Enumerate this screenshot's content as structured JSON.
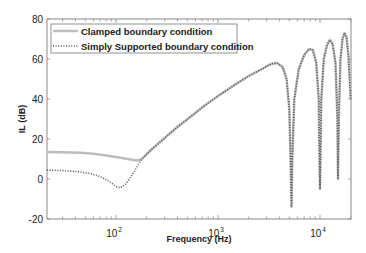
{
  "chart_data": {
    "type": "line",
    "title": "",
    "xlabel": "Frequency (Hz)",
    "ylabel": "IL (dB)",
    "xscale": "log",
    "xlim": [
      21,
      20000
    ],
    "ylim": [
      -20,
      80
    ],
    "yticks": [
      -20,
      0,
      20,
      40,
      60,
      80
    ],
    "yticklabels": [
      "-20",
      "0",
      "20",
      "40",
      "60",
      "80"
    ],
    "xticks": [
      100,
      1000,
      10000
    ],
    "xticklabels": [
      {
        "base": "10",
        "exp": "2"
      },
      {
        "base": "10",
        "exp": "3"
      },
      {
        "base": "10",
        "exp": "4"
      }
    ],
    "grid": false,
    "legend_position": "upper left",
    "series": [
      {
        "name": "Clamped boundary condition",
        "style": "solid",
        "color": "#bdbdbd",
        "points": [
          [
            21,
            13.5
          ],
          [
            30,
            13.4
          ],
          [
            45,
            13.1
          ],
          [
            60,
            12.6
          ],
          [
            80,
            11.8
          ],
          [
            100,
            11.0
          ],
          [
            130,
            10.0
          ],
          [
            160,
            9.2
          ],
          [
            175,
            9.6
          ],
          [
            220,
            14.5
          ],
          [
            300,
            20.5
          ],
          [
            400,
            26
          ],
          [
            550,
            31.5
          ],
          [
            750,
            37
          ],
          [
            1000,
            41.5
          ],
          [
            1500,
            47.5
          ],
          [
            2000,
            51.5
          ],
          [
            2700,
            55
          ],
          [
            3300,
            57.5
          ],
          [
            3800,
            58
          ],
          [
            4300,
            56
          ],
          [
            4700,
            50
          ],
          [
            5000,
            35
          ],
          [
            5150,
            10
          ],
          [
            5250,
            -14
          ],
          [
            5350,
            10
          ],
          [
            5600,
            40
          ],
          [
            6200,
            55
          ],
          [
            7000,
            62
          ],
          [
            7800,
            65
          ],
          [
            8500,
            64.5
          ],
          [
            9200,
            58
          ],
          [
            9700,
            40
          ],
          [
            10000,
            -5
          ],
          [
            10300,
            40
          ],
          [
            10900,
            60
          ],
          [
            11700,
            67
          ],
          [
            12500,
            69.5
          ],
          [
            13300,
            67.5
          ],
          [
            14200,
            58
          ],
          [
            14800,
            30
          ],
          [
            15000,
            0
          ],
          [
            15300,
            30
          ],
          [
            15900,
            60
          ],
          [
            16600,
            70
          ],
          [
            17400,
            73
          ],
          [
            18200,
            71
          ],
          [
            19000,
            62
          ],
          [
            20000,
            40
          ]
        ]
      },
      {
        "name": "Simply Supported boundary condition",
        "style": "dotted",
        "color": "#555555",
        "points": [
          [
            21,
            4.5
          ],
          [
            30,
            4.2
          ],
          [
            40,
            3.8
          ],
          [
            55,
            2.8
          ],
          [
            70,
            1.2
          ],
          [
            85,
            -1.0
          ],
          [
            100,
            -3.8
          ],
          [
            110,
            -4.4
          ],
          [
            125,
            -2.5
          ],
          [
            150,
            3.5
          ],
          [
            175,
            9.4
          ],
          [
            220,
            14.5
          ],
          [
            300,
            20.5
          ],
          [
            400,
            26
          ],
          [
            550,
            31.5
          ],
          [
            750,
            37
          ],
          [
            1000,
            41.5
          ],
          [
            1500,
            47.5
          ],
          [
            2000,
            51.5
          ],
          [
            2700,
            55
          ],
          [
            3300,
            57.5
          ],
          [
            3800,
            58
          ],
          [
            4300,
            56
          ],
          [
            4700,
            50
          ],
          [
            5000,
            35
          ],
          [
            5150,
            10
          ],
          [
            5250,
            -14
          ],
          [
            5350,
            10
          ],
          [
            5600,
            40
          ],
          [
            6200,
            55
          ],
          [
            7000,
            62
          ],
          [
            7800,
            65
          ],
          [
            8500,
            64.5
          ],
          [
            9200,
            58
          ],
          [
            9700,
            40
          ],
          [
            10000,
            -5
          ],
          [
            10300,
            40
          ],
          [
            10900,
            60
          ],
          [
            11700,
            67
          ],
          [
            12500,
            69.5
          ],
          [
            13300,
            67.5
          ],
          [
            14200,
            58
          ],
          [
            14800,
            30
          ],
          [
            15000,
            0
          ],
          [
            15300,
            30
          ],
          [
            15900,
            60
          ],
          [
            16600,
            70
          ],
          [
            17400,
            73
          ],
          [
            18200,
            71
          ],
          [
            19000,
            62
          ],
          [
            20000,
            40
          ]
        ]
      }
    ]
  },
  "legend": {
    "items": [
      {
        "label": "Clamped boundary condition"
      },
      {
        "label": "Simply Supported boundary condition"
      }
    ]
  },
  "axes": {
    "xlabel": "Frequency (Hz)",
    "ylabel": "IL (dB)"
  }
}
